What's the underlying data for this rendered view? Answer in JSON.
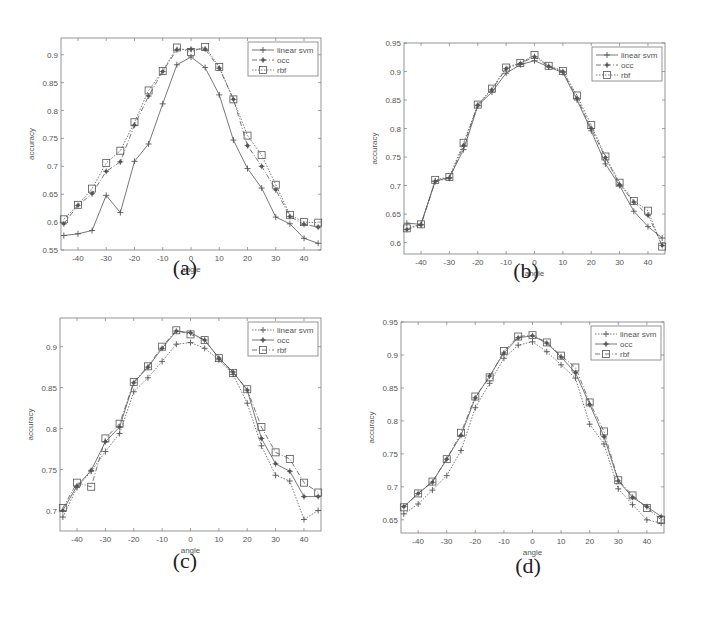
{
  "figure": {
    "captions": [
      "(a)",
      "(b)",
      "(c)",
      "(d)"
    ]
  },
  "chart_data": [
    {
      "id": "a",
      "type": "line",
      "caption": "(a)",
      "title": "",
      "xlabel": "angle",
      "ylabel": "accuracy",
      "xlim": [
        -46,
        46
      ],
      "ylim": [
        0.55,
        0.93
      ],
      "xticks": [
        -40,
        -30,
        -20,
        -10,
        0,
        10,
        20,
        30,
        40
      ],
      "yticks": [
        0.55,
        0.6,
        0.65,
        0.7,
        0.75,
        0.8,
        0.85,
        0.9
      ],
      "ytick_labels": [
        "0.55",
        "0.6",
        "0.65",
        "0.7",
        "0.75",
        "0.8",
        "0.85",
        "0.9"
      ],
      "grid": false,
      "legend_position": "upper right",
      "x": [
        -45,
        -40,
        -35,
        -30,
        -25,
        -20,
        -15,
        -10,
        -5,
        0,
        5,
        10,
        15,
        20,
        25,
        30,
        35,
        40,
        45
      ],
      "series": [
        {
          "name": "linear svm",
          "marker": "+",
          "dash": "solid",
          "values": [
            0.576,
            0.579,
            0.585,
            0.648,
            0.617,
            0.709,
            0.74,
            0.812,
            0.882,
            0.896,
            0.877,
            0.828,
            0.747,
            0.696,
            0.661,
            0.609,
            0.597,
            0.571,
            0.562
          ]
        },
        {
          "name": "occ",
          "marker": "*",
          "dash": "dashdot",
          "values": [
            0.597,
            0.63,
            0.651,
            0.691,
            0.708,
            0.774,
            0.826,
            0.87,
            0.909,
            0.91,
            0.91,
            0.876,
            0.82,
            0.737,
            0.7,
            0.658,
            0.61,
            0.596,
            0.591
          ]
        },
        {
          "name": "rbf",
          "marker": "square",
          "dash": "dotted",
          "values": [
            0.605,
            0.631,
            0.66,
            0.706,
            0.728,
            0.779,
            0.836,
            0.871,
            0.913,
            0.905,
            0.914,
            0.878,
            0.82,
            0.755,
            0.72,
            0.667,
            0.613,
            0.6,
            0.599
          ]
        }
      ]
    },
    {
      "id": "b",
      "type": "line",
      "caption": "(b)",
      "title": "",
      "xlabel": "angle",
      "ylabel": "accuracy",
      "xlim": [
        -46,
        46
      ],
      "ylim": [
        0.58,
        0.95
      ],
      "xticks": [
        -40,
        -30,
        -20,
        -10,
        0,
        10,
        20,
        30,
        40
      ],
      "yticks": [
        0.6,
        0.65,
        0.7,
        0.75,
        0.8,
        0.85,
        0.9,
        0.95
      ],
      "ytick_labels": [
        "0.6",
        "0.65",
        "0.7",
        "0.75",
        "0.8",
        "0.85",
        "0.9",
        "0.95"
      ],
      "grid": false,
      "legend_position": "upper right",
      "x": [
        -45,
        -40,
        -35,
        -30,
        -25,
        -20,
        -15,
        -10,
        -5,
        0,
        5,
        10,
        15,
        20,
        25,
        30,
        35,
        40,
        45
      ],
      "series": [
        {
          "name": "linear svm",
          "marker": "+",
          "dash": "solid",
          "values": [
            0.634,
            0.632,
            0.708,
            0.714,
            0.763,
            0.84,
            0.864,
            0.897,
            0.912,
            0.919,
            0.908,
            0.898,
            0.85,
            0.796,
            0.738,
            0.7,
            0.655,
            0.628,
            0.608
          ]
        },
        {
          "name": "occ",
          "marker": "*",
          "dash": "dashdot",
          "values": [
            0.623,
            0.631,
            0.707,
            0.713,
            0.77,
            0.841,
            0.868,
            0.905,
            0.914,
            0.926,
            0.909,
            0.9,
            0.853,
            0.8,
            0.749,
            0.702,
            0.671,
            0.648,
            0.595
          ]
        },
        {
          "name": "rbf",
          "marker": "square",
          "dash": "dotted",
          "values": [
            0.625,
            0.632,
            0.71,
            0.715,
            0.775,
            0.842,
            0.87,
            0.907,
            0.915,
            0.929,
            0.91,
            0.901,
            0.858,
            0.806,
            0.751,
            0.705,
            0.673,
            0.656,
            0.593
          ]
        }
      ]
    },
    {
      "id": "c",
      "type": "line",
      "caption": "(c)",
      "title": "",
      "xlabel": "angle",
      "ylabel": "accuracy",
      "xlim": [
        -46,
        46
      ],
      "ylim": [
        0.675,
        0.935
      ],
      "xticks": [
        -40,
        -30,
        -20,
        -10,
        0,
        10,
        20,
        30,
        40
      ],
      "yticks": [
        0.7,
        0.75,
        0.8,
        0.85,
        0.9
      ],
      "ytick_labels": [
        "0.7",
        "0.75",
        "0.8",
        "0.85",
        "0.9"
      ],
      "grid": false,
      "legend_position": "upper right",
      "x": [
        -45,
        -40,
        -35,
        -30,
        -25,
        -20,
        -15,
        -10,
        -5,
        0,
        5,
        10,
        15,
        20,
        25,
        30,
        35,
        40,
        45
      ],
      "series": [
        {
          "name": "linear svm",
          "marker": "+",
          "dash": "dotted",
          "values": [
            0.692,
            0.728,
            0.748,
            0.772,
            0.794,
            0.845,
            0.862,
            0.882,
            0.903,
            0.905,
            0.898,
            0.884,
            0.866,
            0.831,
            0.779,
            0.743,
            0.736,
            0.689,
            0.7
          ]
        },
        {
          "name": "occ",
          "marker": "*",
          "dash": "solid",
          "values": [
            0.7,
            0.73,
            0.749,
            0.784,
            0.802,
            0.856,
            0.875,
            0.898,
            0.919,
            0.917,
            0.908,
            0.886,
            0.869,
            0.847,
            0.788,
            0.757,
            0.748,
            0.717,
            0.717
          ]
        },
        {
          "name": "rbf",
          "marker": "square",
          "dash": "dashdot",
          "values": [
            0.703,
            0.734,
            0.729,
            0.788,
            0.806,
            0.857,
            0.876,
            0.9,
            0.92,
            0.915,
            0.908,
            0.886,
            0.868,
            0.848,
            0.802,
            0.771,
            0.763,
            0.734,
            0.722
          ]
        }
      ]
    },
    {
      "id": "d",
      "type": "line",
      "caption": "(d)",
      "title": "",
      "xlabel": "angle",
      "ylabel": "accuracy",
      "xlim": [
        -46,
        46
      ],
      "ylim": [
        0.63,
        0.95
      ],
      "xticks": [
        -40,
        -30,
        -20,
        -10,
        0,
        10,
        20,
        30,
        40
      ],
      "yticks": [
        0.65,
        0.7,
        0.75,
        0.8,
        0.85,
        0.9,
        0.95
      ],
      "ytick_labels": [
        "0.65",
        "0.7",
        "0.75",
        "0.8",
        "0.85",
        "0.9",
        "0.95"
      ],
      "grid": false,
      "legend_position": "upper right",
      "x": [
        -45,
        -40,
        -35,
        -30,
        -25,
        -20,
        -15,
        -10,
        -5,
        0,
        5,
        10,
        15,
        20,
        25,
        30,
        35,
        40,
        45
      ],
      "series": [
        {
          "name": "linear svm",
          "marker": "+",
          "dash": "dotted",
          "values": [
            0.659,
            0.674,
            0.695,
            0.717,
            0.755,
            0.82,
            0.857,
            0.895,
            0.915,
            0.92,
            0.905,
            0.885,
            0.865,
            0.795,
            0.765,
            0.697,
            0.673,
            0.65,
            0.645
          ]
        },
        {
          "name": "occ",
          "marker": "*",
          "dash": "solid",
          "values": [
            0.67,
            0.69,
            0.707,
            0.742,
            0.778,
            0.835,
            0.868,
            0.903,
            0.926,
            0.929,
            0.918,
            0.897,
            0.873,
            0.825,
            0.776,
            0.709,
            0.684,
            0.67,
            0.655
          ]
        },
        {
          "name": "rbf",
          "marker": "square",
          "dash": "dashdot",
          "values": [
            0.669,
            0.69,
            0.708,
            0.742,
            0.782,
            0.837,
            0.866,
            0.906,
            0.928,
            0.93,
            0.919,
            0.899,
            0.881,
            0.828,
            0.784,
            0.71,
            0.687,
            0.668,
            0.65
          ]
        }
      ]
    }
  ],
  "layout": {
    "plots": [
      {
        "left": 61,
        "top": 38,
        "right": 321,
        "bottom": 250,
        "caption_x": 185,
        "caption_y": 255
      },
      {
        "left": 404,
        "top": 43,
        "right": 665,
        "bottom": 254,
        "caption_x": 526,
        "caption_y": 258
      },
      {
        "left": 60,
        "top": 318,
        "right": 321,
        "bottom": 531,
        "caption_x": 185,
        "caption_y": 548
      },
      {
        "left": 401,
        "top": 322,
        "right": 664,
        "bottom": 533,
        "caption_x": 528,
        "caption_y": 553
      }
    ]
  },
  "colors": {
    "axis": "#7a7a7a",
    "line": "#555555",
    "text": "#555555",
    "caption": "#222222"
  }
}
